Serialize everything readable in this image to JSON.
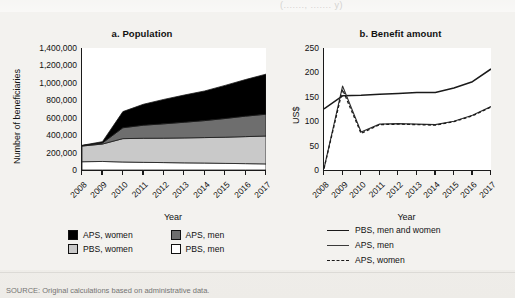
{
  "page": {
    "cut_header": "(......., .......  y)",
    "source_note": "SOURCE: Original calculations based on administrative data.",
    "ink_color": "#1a1a1a",
    "paper_color": "#f2f1ee"
  },
  "panel_a": {
    "title": "a. Population",
    "ylabel": "Number of beneficiaries",
    "xlabel": "Year",
    "legend": [
      {
        "label": "APS, women",
        "color": "#000000"
      },
      {
        "label": "APS, men",
        "color": "#6e6e6e"
      },
      {
        "label": "PBS, women",
        "color": "#c9c9c9"
      },
      {
        "label": "PBS, men",
        "color": "#ffffff"
      }
    ]
  },
  "panel_b": {
    "title": "b. Benefit amount",
    "ylabel": "US$",
    "xlabel": "Year",
    "legend": [
      {
        "label": "PBS, men and women",
        "style": "solid-thick"
      },
      {
        "label": "APS, men",
        "style": "solid-thin"
      },
      {
        "label": "APS, women",
        "style": "dashed"
      }
    ]
  },
  "chart_data": [
    {
      "type": "area",
      "id": "population",
      "title": "a. Population",
      "xlabel": "Year",
      "ylabel": "Number of beneficiaries",
      "stacked": true,
      "grid": false,
      "legend_position": "below",
      "x": [
        2008,
        2009,
        2010,
        2011,
        2012,
        2013,
        2014,
        2015,
        2016,
        2017
      ],
      "xlim": [
        2008,
        2017
      ],
      "ylim": [
        0,
        1400000
      ],
      "yticks": [
        0,
        200000,
        400000,
        600000,
        800000,
        1000000,
        1200000,
        1400000
      ],
      "ytick_labels": [
        "0",
        "200,000",
        "400,000",
        "600,000",
        "800,000",
        "1,000,000",
        "1,200,000",
        "1,400,000"
      ],
      "xtick_labels": [
        "2008",
        "2009",
        "2010",
        "2011",
        "2012",
        "2013",
        "2014",
        "2015",
        "2016",
        "2017"
      ],
      "series": [
        {
          "name": "PBS, men",
          "color": "#ffffff",
          "values": [
            95000,
            98000,
            92000,
            88000,
            85000,
            82000,
            80000,
            76000,
            73000,
            70000
          ]
        },
        {
          "name": "PBS, women",
          "color": "#c9c9c9",
          "values": [
            180000,
            200000,
            268000,
            276000,
            280000,
            286000,
            292000,
            300000,
            310000,
            320000
          ]
        },
        {
          "name": "APS, men",
          "color": "#6e6e6e",
          "values": [
            5000,
            12000,
            125000,
            150000,
            165000,
            180000,
            195000,
            215000,
            235000,
            250000
          ]
        },
        {
          "name": "APS, women",
          "color": "#000000",
          "values": [
            3000,
            15000,
            185000,
            240000,
            280000,
            312000,
            340000,
            380000,
            420000,
            460000
          ]
        }
      ],
      "totals": [
        283000,
        325000,
        670000,
        754000,
        810000,
        860000,
        907000,
        971000,
        1038000,
        1100000
      ]
    },
    {
      "type": "line",
      "id": "benefit-amount",
      "title": "b. Benefit amount",
      "xlabel": "Year",
      "ylabel": "US$",
      "grid": false,
      "legend_position": "below",
      "x": [
        2008,
        2009,
        2010,
        2011,
        2012,
        2013,
        2014,
        2015,
        2016,
        2017
      ],
      "xlim": [
        2008,
        2017
      ],
      "ylim": [
        0,
        250
      ],
      "yticks": [
        0,
        50,
        100,
        150,
        200,
        250
      ],
      "ytick_labels": [
        "0",
        "50",
        "100",
        "150",
        "200",
        "250"
      ],
      "xtick_labels": [
        "2008",
        "2009",
        "2010",
        "2011",
        "2012",
        "2013",
        "2014",
        "2015",
        "2016",
        "2017"
      ],
      "series": [
        {
          "name": "PBS, men and women",
          "style": "solid-thick",
          "values": [
            125,
            152,
            153,
            155,
            157,
            159,
            159,
            168,
            181,
            207
          ]
        },
        {
          "name": "APS, men",
          "style": "solid-thin",
          "values": [
            3,
            172,
            78,
            94,
            95,
            94,
            93,
            100,
            112,
            130
          ]
        },
        {
          "name": "APS, women",
          "style": "dashed",
          "values": [
            3,
            165,
            75,
            93,
            94,
            93,
            92,
            99,
            111,
            129
          ]
        }
      ]
    }
  ]
}
